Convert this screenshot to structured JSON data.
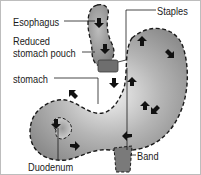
{
  "diagram": {
    "labels": {
      "esophagus": "Esophagus",
      "staples": "Staples",
      "reduced_pouch_line1": "Reduced",
      "reduced_pouch_line2": "stomach pouch",
      "stomach": "stomach",
      "band": "Band",
      "duodenum": "Duodenum"
    },
    "colors": {
      "border": "#bdbdbd",
      "organ_fill": "#8a8a8a",
      "organ_light": "#e6e6e6",
      "outline": "#1a1a1a",
      "staples": "#6e6e6e"
    }
  }
}
